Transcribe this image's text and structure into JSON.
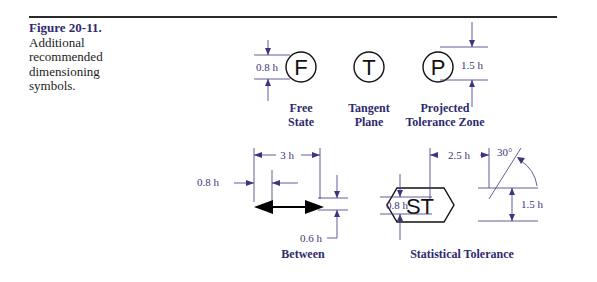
{
  "caption": {
    "figure_number": "Figure 20-11.",
    "text": "Additional recommended dimensioning symbols."
  },
  "symbols": {
    "free_state": {
      "glyph": "F",
      "label_line1": "Free",
      "label_line2": "State",
      "dimension": "0.8 h"
    },
    "tangent_plane": {
      "glyph": "T",
      "label_line1": "Tangent",
      "label_line2": "Plane"
    },
    "projected_tolerance_zone": {
      "glyph": "P",
      "label_line1": "Projected",
      "label_line2": "Tolerance Zone",
      "dimension": "1.5 h"
    },
    "between": {
      "label": "Between",
      "width_dim": "3 h",
      "arrow_dim": "0.8 h",
      "shaft_dim": "0.6 h"
    },
    "statistical_tolerance": {
      "glyph": "ST",
      "label": "Statistical Tolerance",
      "width_dim": "2.5 h",
      "angle": "30°",
      "height_dim": "1.5 h",
      "text_dim": "0.8 h"
    }
  },
  "colors": {
    "accent": "#2e2a6e",
    "dimension": "#3a3580",
    "rule": "#2a2a2a"
  }
}
